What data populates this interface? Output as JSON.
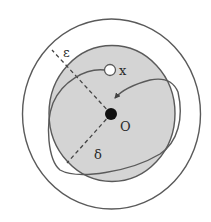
{
  "diagram": {
    "type": "stability-neighborhood-illustration",
    "labels": {
      "epsilon": "ε",
      "delta": "δ",
      "origin": "O",
      "start_point": "x"
    },
    "colors": {
      "stroke": "#5a5a5a",
      "shaded_fill": "#d4d4d4",
      "origin_dot": "#111111",
      "background": "#ffffff"
    },
    "elements": [
      {
        "name": "outer-circle",
        "meaning": "ε-neighborhood"
      },
      {
        "name": "inner-shaded-disk",
        "meaning": "δ-neighborhood"
      },
      {
        "name": "origin-dot",
        "label": "O"
      },
      {
        "name": "start-point",
        "label": "x"
      },
      {
        "name": "trajectory",
        "meaning": "spiral path from x toward O"
      },
      {
        "name": "epsilon-radius",
        "style": "dashed"
      },
      {
        "name": "delta-radius",
        "style": "dashed"
      }
    ]
  }
}
